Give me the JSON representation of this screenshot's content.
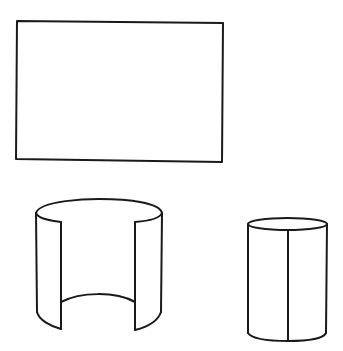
{
  "canvas": {
    "width": 343,
    "height": 351,
    "background": "#ffffff",
    "stroke_color": "#1a1a1a"
  },
  "shapes": [
    {
      "id": "rectangle",
      "label": "Rectangle (flat sheet)",
      "corners": [
        [
          17,
          21
        ],
        [
          223,
          23
        ],
        [
          222,
          162
        ],
        [
          16,
          159
        ]
      ]
    },
    {
      "id": "open-cylinder",
      "label": "Curved sheet forming open cylinder",
      "outer_left_x": 36,
      "outer_right_x": 162,
      "top_y": 213,
      "inner_left_x": 61,
      "inner_right_x": 135
    },
    {
      "id": "closed-cylinder",
      "label": "Closed cylinder with seam",
      "left_x": 248,
      "right_x": 327,
      "top_y": 224,
      "bottom_y": 333,
      "seam_x": 288
    }
  ]
}
